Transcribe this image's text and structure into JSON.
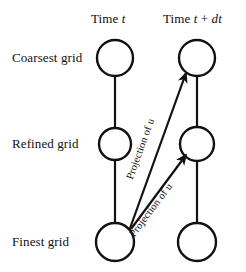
{
  "figure": {
    "type": "diagram",
    "background_color": "#ffffff",
    "stroke_color": "#111111"
  },
  "columns": [
    {
      "id": "time-t",
      "label_prefix": "Time ",
      "label_var": "t",
      "label_suffix": "",
      "label_full": "Time t",
      "x": 115
    },
    {
      "id": "time-t-plus-dt",
      "label_prefix": "Time ",
      "label_var": "t",
      "label_mid": " + ",
      "label_var2": "dt",
      "label_full": "Time t + dt",
      "x": 197
    }
  ],
  "rows": [
    {
      "id": "coarsest-grid",
      "label": "Coarsest grid",
      "y": 58
    },
    {
      "id": "refined-grid",
      "label": "Refined grid",
      "y": 144
    },
    {
      "id": "finest-grid",
      "label": "Finest grid",
      "y": 242
    }
  ],
  "nodes": [
    {
      "id": "node-coarse-t",
      "row": "coarsest-grid",
      "column": "time-t",
      "cx": 115,
      "cy": 58,
      "rx": 18,
      "ry": 18
    },
    {
      "id": "node-coarse-tdt",
      "row": "coarsest-grid",
      "column": "time-t-plus-dt",
      "cx": 197,
      "cy": 58,
      "rx": 18,
      "ry": 18
    },
    {
      "id": "node-refined-t",
      "row": "refined-grid",
      "column": "time-t",
      "cx": 115,
      "cy": 144,
      "rx": 16,
      "ry": 16
    },
    {
      "id": "node-refined-tdt",
      "row": "refined-grid",
      "column": "time-t-plus-dt",
      "cx": 197,
      "cy": 144,
      "rx": 17,
      "ry": 17
    },
    {
      "id": "node-finest-t",
      "row": "finest-grid",
      "column": "time-t",
      "cx": 115,
      "cy": 242,
      "rx": 19,
      "ry": 19
    },
    {
      "id": "node-finest-tdt",
      "row": "finest-grid",
      "column": "time-t-plus-dt",
      "cx": 197,
      "cy": 242,
      "rx": 19,
      "ry": 19
    }
  ],
  "connectors": [
    {
      "id": "link-coarse-to-refined-t",
      "from": "node-coarse-t",
      "to": "node-refined-t",
      "arrow": false
    },
    {
      "id": "link-refined-to-finest-t",
      "from": "node-refined-t",
      "to": "node-finest-t",
      "arrow": false
    },
    {
      "id": "link-coarse-to-refined-tdt",
      "from": "node-coarse-tdt",
      "to": "node-refined-tdt",
      "arrow": false
    },
    {
      "id": "link-refined-to-finest-tdt",
      "from": "node-refined-tdt",
      "to": "node-finest-tdt",
      "arrow": false
    }
  ],
  "projections": [
    {
      "id": "projection-to-coarse",
      "label": "Projection of u",
      "from": "node-finest-t",
      "to": "node-coarse-tdt",
      "arrow": true,
      "label_angle_deg": -50
    },
    {
      "id": "projection-to-refined",
      "label": "Projection of u",
      "from": "node-finest-t",
      "to": "node-refined-tdt",
      "arrow": true,
      "label_angle_deg": -42
    }
  ]
}
